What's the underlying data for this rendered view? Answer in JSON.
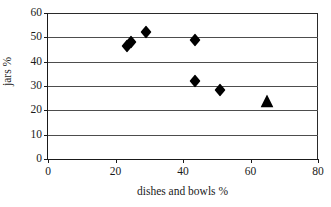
{
  "chart_data": {
    "type": "scatter",
    "title": "",
    "xlabel": "dishes and bowls %",
    "ylabel": "jars %",
    "xlim": [
      0,
      80
    ],
    "ylim": [
      0,
      60
    ],
    "xticks": [
      0,
      20,
      40,
      60,
      80
    ],
    "yticks": [
      0,
      10,
      20,
      30,
      40,
      50,
      60
    ],
    "xtick_labels": [
      "0",
      "20",
      "40",
      "60",
      "80"
    ],
    "ytick_labels": [
      "0",
      "10",
      "20",
      "30",
      "40",
      "50",
      "60"
    ],
    "grid": "horizontal",
    "legend": "none",
    "marker_color": "#000000",
    "series": [
      {
        "name": "sites",
        "marker": "diamond",
        "color": "#000000",
        "points": [
          {
            "x": 23.5,
            "y": 46.5
          },
          {
            "x": 24.5,
            "y": 48.0
          },
          {
            "x": 29.0,
            "y": 52.0
          },
          {
            "x": 43.5,
            "y": 49.0
          },
          {
            "x": 43.5,
            "y": 32.0
          },
          {
            "x": 51.0,
            "y": 28.5
          }
        ]
      },
      {
        "name": "highlighted site",
        "marker": "triangle",
        "color": "#000000",
        "points": [
          {
            "x": 65.0,
            "y": 24.0
          }
        ]
      }
    ]
  }
}
